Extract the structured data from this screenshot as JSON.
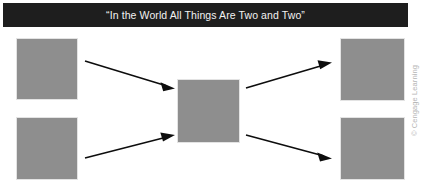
{
  "figure": {
    "width": 429,
    "height": 191,
    "background_color": "#ffffff"
  },
  "banner": {
    "title": "“In the World All Things Are Two and Two”",
    "background_color": "#1e1e1e",
    "text_color": "#f2f2f2"
  },
  "boxes": {
    "fill_color": "#8e8e8e",
    "items": [
      {
        "name": "top-left",
        "label": ""
      },
      {
        "name": "bottom-left",
        "label": ""
      },
      {
        "name": "center",
        "label": ""
      },
      {
        "name": "top-right",
        "label": ""
      },
      {
        "name": "bottom-right",
        "label": ""
      }
    ]
  },
  "arrows": {
    "color": "#0d0d0d",
    "items": [
      {
        "name": "top-left-to-center",
        "from": "top-left",
        "to": "center"
      },
      {
        "name": "bottom-left-to-center",
        "from": "bottom-left",
        "to": "center"
      },
      {
        "name": "center-to-top-right",
        "from": "center",
        "to": "top-right"
      },
      {
        "name": "center-to-bottom-right",
        "from": "center",
        "to": "bottom-right"
      }
    ]
  },
  "credit": {
    "text": "© Cengage Learning",
    "color": "#b5b5b5"
  }
}
